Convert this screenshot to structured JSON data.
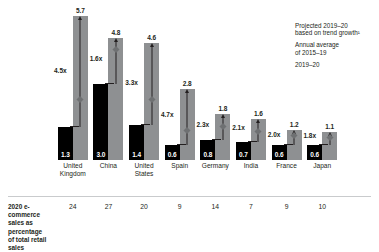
{
  "chart_data": {
    "type": "bar",
    "title": "",
    "xlabel": "",
    "ylabel": "",
    "ylim": [
      0,
      6.0
    ],
    "grid": false,
    "legend_position": "top-right",
    "categories": [
      "United Kingdom",
      "China",
      "United States",
      "Spain",
      "Germany",
      "India",
      "France",
      "Japan"
    ],
    "series": [
      {
        "name": "Annual average of 2015–19",
        "color": "#000000",
        "values": [
          1.3,
          3.0,
          1.4,
          0.6,
          0.8,
          0.7,
          0.6,
          0.6
        ]
      },
      {
        "name": "2019–20",
        "color": "#8e9092",
        "values": [
          5.7,
          4.8,
          4.6,
          2.8,
          1.8,
          1.6,
          1.2,
          1.1
        ]
      }
    ],
    "annotations": {
      "multipliers": [
        "4.5x",
        "1.6x",
        "3.3x",
        "4.7x",
        "2.3x",
        "2.1x",
        "2.0x",
        "1.8x"
      ],
      "projected_marker_label": "Projected 2019–20 based on trend growth"
    },
    "footer_row": {
      "label": "2020 e-commerce sales as percentage of total retail sales",
      "values": [
        24,
        27,
        20,
        9,
        14,
        7,
        9,
        10
      ]
    }
  },
  "legend": {
    "items": [
      {
        "marker": "diamond-marker",
        "line1": "Projected 2019–20",
        "line2": "based on trend growth¹"
      },
      {
        "marker": "black-square-marker",
        "line1": "Annual average",
        "line2": "of 2015–19"
      },
      {
        "marker": "gray-square-marker",
        "line1": "2019–20",
        "line2": ""
      }
    ]
  },
  "footer": {
    "label_line1": "2020 e-commerce",
    "label_line2": "sales as percentage",
    "label_line3": "of total retail sales"
  },
  "colors": {
    "black_series": "#000000",
    "gray_series": "#8e9092",
    "diamond": "#6e7072",
    "text": "#231f20",
    "rule": "#c9cbcd"
  }
}
